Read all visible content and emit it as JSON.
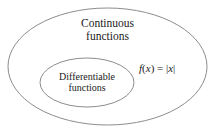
{
  "diagram": {
    "type": "venn-euler",
    "background_color": "#ffffff",
    "stroke_color": "#8c8c8c",
    "text_color": "#1a1a1a",
    "sets": [
      {
        "name": "continuous-functions",
        "label_line1": "Continuous",
        "label_line2": "functions",
        "shape": "ellipse",
        "cx": 107.5,
        "cy": 66.5,
        "rx": 99.5,
        "ry": 58.5
      },
      {
        "name": "differentiable-functions",
        "label_line1": "Differentiable",
        "label_line2": "functions",
        "shape": "ellipse",
        "cx": 87,
        "cy": 82.5,
        "rx": 47,
        "ry": 24.5
      }
    ],
    "annotation": {
      "name": "absolute-value-function",
      "function_name": "f",
      "argument": "x",
      "open_paren": "(",
      "close_paren": ")",
      "equals": " = ",
      "bar_left": "|",
      "bar_right": "|",
      "expression_variable": "x",
      "full_text": "f(x) = |x|"
    }
  }
}
